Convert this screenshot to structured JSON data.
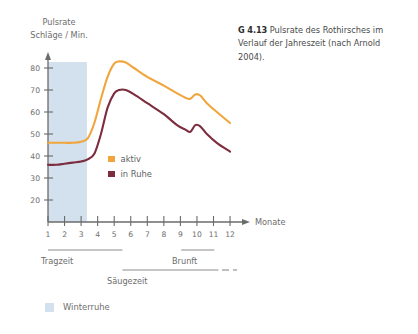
{
  "caption": {
    "code": "G 4.13",
    "text": "Pulsrate des Rothirsches im Verlauf der Jahreszeit (nach Arnold 2004)."
  },
  "axis_title": {
    "line1": "Pulsrate",
    "line2": "Schläge / Min."
  },
  "legend": {
    "items": [
      {
        "label": "aktiv",
        "color": "#f0a63c"
      },
      {
        "label": "in Ruhe",
        "color": "#7c2d3f"
      }
    ]
  },
  "phases": [
    {
      "name": "Tragzeit",
      "label": "Tragzeit"
    },
    {
      "name": "Brunft",
      "label": "Brunft"
    },
    {
      "name": "Säugezeit",
      "label": "Säugezeit"
    }
  ],
  "phase_labels": {
    "tragzeit": "Tragzeit",
    "brunft": "Brunft",
    "saugezeit": "Säugezeit"
  },
  "bottom_legend": {
    "label": "Winterruhe",
    "color": "#d3e1ee"
  },
  "colors": {
    "aktiv": "#f0a63c",
    "in_ruhe": "#7c2d3f",
    "winterruhe_band": "#d3e1ee",
    "axis": "#6b6b6b",
    "text": "#6d6d6d"
  },
  "chart_data": {
    "type": "line",
    "title": "Pulsrate des Rothirsches im Verlauf der Jahreszeit (nach Arnold 2004).",
    "xlabel": "Monate",
    "ylabel": "Pulsrate Schläge / Min.",
    "xlim": [
      1,
      12
    ],
    "ylim": [
      0,
      88
    ],
    "yticks": [
      20,
      30,
      40,
      50,
      60,
      70,
      80
    ],
    "xticks": [
      1,
      2,
      3,
      4,
      5,
      6,
      7,
      8,
      9,
      10,
      11,
      12
    ],
    "xtick_labels": [
      "1",
      "2",
      "3",
      "4",
      "5",
      "6",
      "7",
      "8",
      "9",
      "10",
      "11",
      "12"
    ],
    "ytick_labels": [
      "20",
      "30",
      "40",
      "50",
      "60",
      "70",
      "80"
    ],
    "grid": false,
    "legend_position": "inside-center",
    "x": [
      1,
      1.5,
      2,
      2.5,
      3,
      3.4,
      3.8,
      4.2,
      4.6,
      5,
      5.3,
      5.7,
      6.2,
      7,
      8,
      8.8,
      9.3,
      9.6,
      9.9,
      10.2,
      10.6,
      11.2,
      12
    ],
    "series": [
      {
        "name": "aktiv",
        "color": "#f0a63c",
        "values": [
          46,
          46,
          46,
          46,
          46.5,
          48,
          55,
          66,
          76,
          82,
          83,
          82.5,
          80,
          76,
          72,
          68.5,
          66.5,
          66,
          68,
          67.5,
          64,
          60,
          55
        ]
      },
      {
        "name": "in Ruhe",
        "color": "#7c2d3f",
        "values": [
          36,
          36,
          36.5,
          37,
          37.5,
          38.5,
          41,
          50,
          62,
          68.5,
          70,
          70,
          68,
          64,
          59,
          54,
          52,
          51,
          54,
          53.5,
          50,
          46,
          42
        ]
      }
    ],
    "shaded_regions": [
      {
        "name": "Winterruhe",
        "x_start": 1,
        "x_end": 3.35,
        "color": "#d3e1ee"
      }
    ],
    "phase_bars": [
      {
        "name": "Tragzeit",
        "x_start": 1,
        "x_end": 5.5,
        "style": "solid"
      },
      {
        "name": "Brunft",
        "x_start": 9.05,
        "x_end": 11.05,
        "style": "solid"
      },
      {
        "name": "Säugezeit",
        "x_start": 5.5,
        "x_end": 11.3,
        "style": "solid-then-dashed"
      }
    ],
    "annotations": [
      "Winterruhe shading covers months 1 to ~3.4",
      "Secondary peak during Brunft (rut) around month 10 in both series"
    ]
  }
}
